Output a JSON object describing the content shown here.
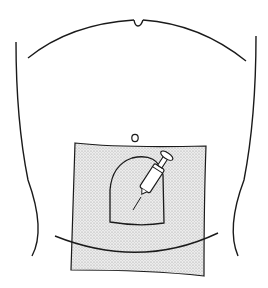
{
  "figure": {
    "colors": {
      "line": "#1a1a1a",
      "drape_fill": "#e4e4e4",
      "background": "#ffffff",
      "syringe_fill": "#ffffff"
    },
    "elements": [
      {
        "name": "rib-margin-arc",
        "label": ""
      },
      {
        "name": "torso-left-outline",
        "label": ""
      },
      {
        "name": "torso-right-outline",
        "label": ""
      },
      {
        "name": "umbilicus",
        "label": ""
      },
      {
        "name": "sterile-drape",
        "label": ""
      },
      {
        "name": "drape-window",
        "label": ""
      },
      {
        "name": "syringe",
        "label": ""
      },
      {
        "name": "iliac-crest-line",
        "label": ""
      }
    ]
  }
}
